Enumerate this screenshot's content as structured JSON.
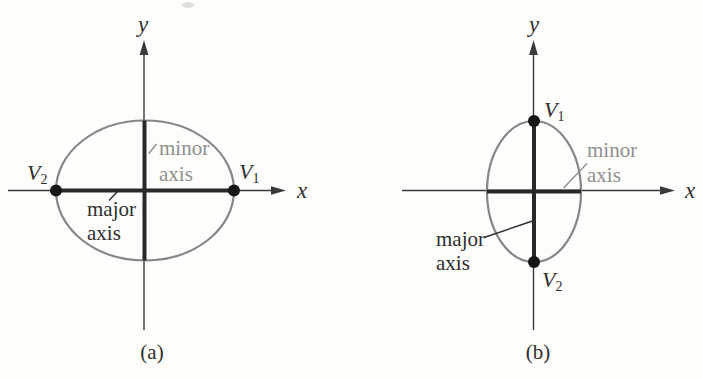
{
  "colors": {
    "background": "#fdfdfb",
    "axis_color": "#3a3a3a",
    "ellipse_color": "#868686",
    "bar_color": "#282828",
    "dot_color": "#161616",
    "gray_text": "#8f8f8f",
    "dark_text": "#2e2e2e"
  },
  "panel_a": {
    "caption": "(a)",
    "y_label": "y",
    "x_label": "x",
    "vertex_left": {
      "base": "V",
      "sub": "2"
    },
    "vertex_right": {
      "base": "V",
      "sub": "1"
    },
    "minor_line1": "minor",
    "minor_line2": "axis",
    "major_line1": "major",
    "major_line2": "axis"
  },
  "panel_b": {
    "caption": "(b)",
    "y_label": "y",
    "x_label": "x",
    "vertex_top": {
      "base": "V",
      "sub": "1"
    },
    "vertex_bottom": {
      "base": "V",
      "sub": "2"
    },
    "minor_line1": "minor",
    "minor_line2": "axis",
    "major_line1": "major",
    "major_line2": "axis"
  }
}
